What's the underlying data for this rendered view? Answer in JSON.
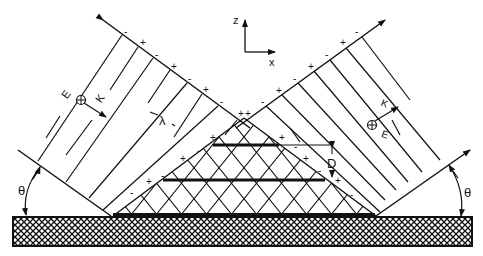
{
  "diagram": {
    "axes": {
      "z_label": "z",
      "x_label": "x"
    },
    "incident_beam": {
      "field_label": "E",
      "field_subscript": "o",
      "wavevector_label": "K",
      "wavevector_subscript": "o",
      "wavelength_label": "λ"
    },
    "reflected_beam": {
      "field_label": "E",
      "field_subscript": "R",
      "wavevector_label": "K",
      "wavevector_subscript": "R"
    },
    "fringe_spacing_label": "D",
    "angle_left_label": "θ",
    "angle_right_label": "θ",
    "charge_signs": [
      "-",
      "+"
    ],
    "colors": {
      "ink": "#111111",
      "background": "#ffffff"
    }
  }
}
